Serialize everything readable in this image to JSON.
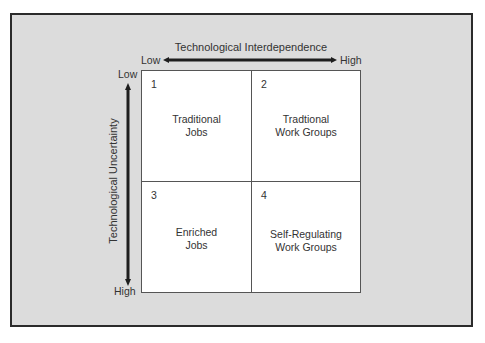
{
  "x_axis": {
    "title": "Technological Interdependence",
    "low_label": "Low",
    "high_label": "High"
  },
  "y_axis": {
    "title": "Technological Uncertainty",
    "low_label": "Low",
    "high_label": "High"
  },
  "quadrants": [
    {
      "number": "1",
      "line1": "Traditional",
      "line2": "Jobs"
    },
    {
      "number": "2",
      "line1": "Tradtional",
      "line2": "Work Groups"
    },
    {
      "number": "3",
      "line1": "Enriched",
      "line2": "Jobs"
    },
    {
      "number": "4",
      "line1": "Self-Regulating",
      "line2": "Work Groups"
    }
  ],
  "colors": {
    "frame_fill": "#dcdcdc",
    "frame_border": "#2b2b2b",
    "grid_fill": "#ffffff",
    "arrow": "#1e1e1e"
  }
}
